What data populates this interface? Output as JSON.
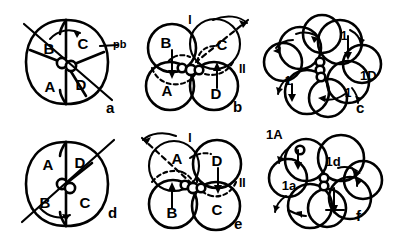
{
  "figure": {
    "background_color": "#ffffff",
    "ink_color": "#000000",
    "width": 395,
    "height": 240,
    "layout": "2 rows x 3 columns of embryo schematics"
  },
  "panels": [
    {
      "id": "a",
      "letter": "a",
      "row": 0,
      "col": 0,
      "stage": "4-cell embryo, dextral (polar view)",
      "quadrants": [
        "B",
        "C",
        "A",
        "D"
      ],
      "quadrant_positions": [
        "upper-left",
        "upper-right",
        "lower-left",
        "lower-right"
      ],
      "annotations": [
        "pb"
      ],
      "pb_label": "pb",
      "rotation_arrow": "clockwise",
      "cross_furrow_cells": 2
    },
    {
      "id": "b",
      "letter": "b",
      "row": 0,
      "col": 1,
      "stage": "4-cell embryo, dextral (lateral / blastomere circles)",
      "quadrants": [
        "B",
        "C",
        "A",
        "D"
      ],
      "quadrant_positions": [
        "upper-left",
        "upper-right",
        "lower-left",
        "lower-right"
      ],
      "annotations": [
        "I",
        "II"
      ],
      "furrow_labels": [
        "I",
        "II"
      ],
      "rotation_arrow": "clockwise",
      "cross_furrow_cells": 3
    },
    {
      "id": "c",
      "letter": "c",
      "row": 0,
      "col": 2,
      "stage": "8-cell embryo, dextral, first micromere quartet",
      "quadrants": [],
      "annotations": [
        "1",
        "1",
        "1",
        "1D"
      ],
      "micromere_labels": [
        "1",
        "1",
        "1",
        "1D"
      ],
      "rotation_arrow": "clockwise",
      "cross_furrow_cells": 3
    },
    {
      "id": "d",
      "letter": "d",
      "row": 1,
      "col": 0,
      "stage": "4-cell embryo, sinistral (polar view)",
      "quadrants": [
        "A",
        "D",
        "B",
        "C"
      ],
      "quadrant_positions": [
        "upper-left",
        "upper-right",
        "lower-left",
        "lower-right"
      ],
      "annotations": [],
      "rotation_arrow": "counter-clockwise",
      "cross_furrow_cells": 2
    },
    {
      "id": "e",
      "letter": "e",
      "row": 1,
      "col": 1,
      "stage": "4-cell embryo, sinistral (lateral / blastomere circles)",
      "quadrants": [
        "A",
        "D",
        "B",
        "C"
      ],
      "quadrant_positions": [
        "upper-left",
        "upper-right",
        "lower-left",
        "lower-right"
      ],
      "annotations": [
        "I",
        "II"
      ],
      "furrow_labels": [
        "I",
        "II"
      ],
      "rotation_arrow": "counter-clockwise",
      "cross_furrow_cells": 3
    },
    {
      "id": "f",
      "letter": "f",
      "row": 1,
      "col": 2,
      "stage": "8-cell embryo, sinistral, first micromere quartet",
      "quadrants": [],
      "annotations": [
        "1A",
        "1d",
        "1a"
      ],
      "micromere_labels": [
        "1A",
        "1d",
        "1a"
      ],
      "rotation_arrow": "counter-clockwise",
      "cross_furrow_cells": 3
    }
  ],
  "text": {
    "panel_a_letter": "a",
    "panel_b_letter": "b",
    "panel_c_letter": "c",
    "panel_d_letter": "d",
    "panel_e_letter": "e",
    "panel_f_letter": "f",
    "a_B": "B",
    "a_C": "C",
    "a_A": "A",
    "a_D": "D",
    "a_pb": "pb",
    "b_B": "B",
    "b_C": "C",
    "b_A": "A",
    "b_D": "D",
    "b_I": "I",
    "b_II": "II",
    "c_m1": "1",
    "c_m2": "1",
    "c_m3": "1",
    "c_1D": "1D",
    "d_A": "A",
    "d_D": "D",
    "d_B": "B",
    "d_C": "C",
    "e_A": "A",
    "e_D": "D",
    "e_B": "B",
    "e_C": "C",
    "e_I": "I",
    "e_II": "II",
    "f_1A": "1A",
    "f_1d": "1d",
    "f_1a": "1a"
  }
}
